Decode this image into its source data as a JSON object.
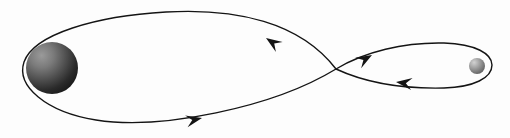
{
  "figure": {
    "title": "Figure-eight orbital trajectory",
    "background_color": "#fdfdfd",
    "width": 510,
    "height": 138
  },
  "chart_data": {
    "type": "diagram",
    "title": "Figure-eight orbital trajectory",
    "xlabel": "",
    "ylabel": "",
    "xlim": [
      0,
      510
    ],
    "ylim": [
      0,
      138
    ],
    "grid": false,
    "legend": "none",
    "bodies": [
      {
        "name": "large-body",
        "label": "",
        "cx": 52,
        "cy": 68,
        "r": 26,
        "fill_light": "#8f8f8f",
        "fill_dark": "#1c1c1c",
        "highlight_offset": "25% 22%"
      },
      {
        "name": "small-body",
        "label": "",
        "cx": 477,
        "cy": 66,
        "r": 8,
        "fill_light": "#c9c9c9",
        "fill_dark": "#5a5a5a",
        "highlight_offset": "30% 25%"
      }
    ],
    "paths": [
      {
        "name": "large-loop",
        "stroke": "#141414",
        "stroke_width": 1.4,
        "closed": false,
        "d": "M 336 69 C 300 22 236 8 166 12 C 96 16 34 34 24 62 C 16 86 46 112 96 120 C 160 130 272 108 336 69"
      },
      {
        "name": "small-loop",
        "stroke": "#141414",
        "stroke_width": 1.4,
        "closed": false,
        "d": "M 336 69 C 364 52 404 42 444 43 C 476 44 492 54 492 65 C 492 78 474 87 444 88 C 402 89 364 82 336 69"
      }
    ],
    "arrows": [
      {
        "name": "arrow-upper-left",
        "x": 266,
        "y": 38,
        "angle": -146,
        "length": 16,
        "width": 6,
        "fill": "#141414",
        "direction": "up-left"
      },
      {
        "name": "arrow-lower-left",
        "x": 202,
        "y": 118,
        "angle": -12,
        "length": 16,
        "width": 6,
        "fill": "#141414",
        "direction": "right"
      },
      {
        "name": "arrow-upper-right",
        "x": 372,
        "y": 55,
        "angle": -30,
        "length": 16,
        "width": 6,
        "fill": "#141414",
        "direction": "up-right"
      },
      {
        "name": "arrow-lower-right",
        "x": 396,
        "y": 82,
        "angle": 187,
        "length": 16,
        "width": 6,
        "fill": "#141414",
        "direction": "left"
      }
    ],
    "crossing_point": {
      "name": "path-crossing",
      "x": 336,
      "y": 69
    }
  }
}
